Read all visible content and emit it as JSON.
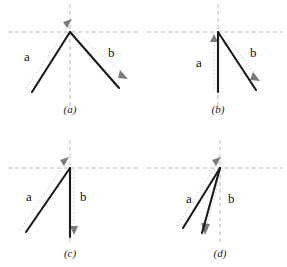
{
  "figure": {
    "background": "#ffffff",
    "width": 287,
    "height": 267,
    "axis_color": "#b9b9b9",
    "guide_color": "#c9c9c9",
    "vector_color": "#1a1a1a",
    "label_color": "#111111"
  },
  "panels": [
    {
      "id": "a",
      "caption": "(a)",
      "origin": {
        "x": 70,
        "y": 32
      },
      "vectors": [
        {
          "name": "a",
          "label": "a",
          "label_pos": {
            "x": 24,
            "y": 50
          },
          "tail": {
            "x": 32,
            "y": 92
          },
          "head": {
            "x": 70,
            "y": 32
          },
          "direction": "up-right",
          "style": "solid"
        },
        {
          "name": "b",
          "label": "b",
          "label_pos": {
            "x": 108,
            "y": 46
          },
          "tail": {
            "x": 70,
            "y": 32
          },
          "head": {
            "x": 119,
            "y": 88
          },
          "direction": "down-right",
          "style": "solid"
        }
      ],
      "guides": [
        {
          "name": "guide-a",
          "tail": {
            "x": 26,
            "y": 88
          },
          "head": {
            "x": 72,
            "y": 22
          },
          "arrow": "up-right"
        },
        {
          "name": "guide-b",
          "tail": {
            "x": 72,
            "y": 30
          },
          "head": {
            "x": 126,
            "y": 76
          },
          "arrow": "down-right"
        }
      ]
    },
    {
      "id": "b",
      "caption": "(b)",
      "origin": {
        "x": 218,
        "y": 32
      },
      "vectors": [
        {
          "name": "a",
          "label": "a",
          "label_pos": {
            "x": 196,
            "y": 56
          },
          "tail": {
            "x": 218,
            "y": 92
          },
          "head": {
            "x": 218,
            "y": 32
          },
          "direction": "up",
          "style": "solid"
        },
        {
          "name": "b",
          "label": "b",
          "label_pos": {
            "x": 250,
            "y": 46
          },
          "tail": {
            "x": 218,
            "y": 32
          },
          "head": {
            "x": 256,
            "y": 90
          },
          "direction": "down-right",
          "style": "solid"
        }
      ],
      "guides": [
        {
          "name": "guide-a",
          "tail": {
            "x": 214,
            "y": 92
          },
          "head": {
            "x": 214,
            "y": 36
          },
          "arrow": "up"
        },
        {
          "name": "guide-b",
          "tail": {
            "x": 220,
            "y": 30
          },
          "head": {
            "x": 259,
            "y": 78
          },
          "arrow": "down-right"
        }
      ]
    },
    {
      "id": "c",
      "caption": "(c)",
      "origin": {
        "x": 70,
        "y": 168
      },
      "vectors": [
        {
          "name": "a",
          "label": "a",
          "label_pos": {
            "x": 26,
            "y": 190
          },
          "tail": {
            "x": 26,
            "y": 232
          },
          "head": {
            "x": 70,
            "y": 168
          },
          "direction": "up-right",
          "style": "solid"
        },
        {
          "name": "b",
          "label": "b",
          "label_pos": {
            "x": 80,
            "y": 190
          },
          "tail": {
            "x": 70,
            "y": 168
          },
          "head": {
            "x": 70,
            "y": 237
          },
          "direction": "down",
          "style": "solid"
        }
      ],
      "guides": [
        {
          "name": "guide-a",
          "tail": {
            "x": 20,
            "y": 230
          },
          "head": {
            "x": 66,
            "y": 160
          },
          "arrow": "up-right"
        },
        {
          "name": "guide-b",
          "tail": {
            "x": 74,
            "y": 170
          },
          "head": {
            "x": 74,
            "y": 233
          },
          "arrow": "down"
        }
      ]
    },
    {
      "id": "d",
      "caption": "(d)",
      "origin": {
        "x": 220,
        "y": 168
      },
      "vectors": [
        {
          "name": "a",
          "label": "a",
          "label_pos": {
            "x": 186,
            "y": 192
          },
          "tail": {
            "x": 183,
            "y": 228
          },
          "head": {
            "x": 220,
            "y": 168
          },
          "direction": "up-right",
          "style": "solid"
        },
        {
          "name": "b",
          "label": "b",
          "label_pos": {
            "x": 228,
            "y": 192
          },
          "tail": {
            "x": 220,
            "y": 168
          },
          "head": {
            "x": 202,
            "y": 233
          },
          "direction": "down-left",
          "style": "solid"
        }
      ],
      "guides": [
        {
          "name": "guide-a",
          "tail": {
            "x": 177,
            "y": 226
          },
          "head": {
            "x": 218,
            "y": 161
          },
          "arrow": "up-right"
        },
        {
          "name": "guide-b",
          "tail": {
            "x": 222,
            "y": 168
          },
          "head": {
            "x": 206,
            "y": 230
          },
          "arrow": "down-left"
        }
      ]
    }
  ]
}
